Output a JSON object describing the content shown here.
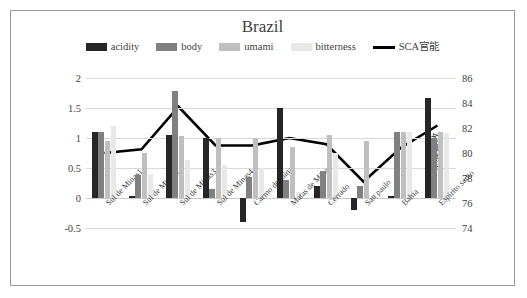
{
  "chart_data": {
    "type": "bar",
    "title": "Brazil",
    "categories": [
      "Sul de Minas1",
      "Sul de Minas2",
      "Sul de Minas3",
      "Sul de Minas4",
      "Carmo de minas",
      "Matas de Minas",
      "Cerrado",
      "San paulo",
      "Bahia",
      "Espirito santo"
    ],
    "series": [
      {
        "name": "acidity",
        "type": "bar",
        "color": "#262626",
        "values": [
          1.1,
          0.03,
          1.05,
          1.0,
          -0.4,
          1.5,
          0.2,
          -0.2,
          0.03,
          1.67
        ]
      },
      {
        "name": "body",
        "type": "bar",
        "color": "#808080",
        "values": [
          1.1,
          0.38,
          1.79,
          0.15,
          0.35,
          0.3,
          0.45,
          0.2,
          1.1,
          1.0
        ]
      },
      {
        "name": "umami",
        "type": "bar",
        "color": "#bfbfbf",
        "values": [
          0.95,
          0.75,
          1.03,
          1.0,
          1.0,
          0.85,
          1.05,
          0.95,
          1.1,
          1.1
        ]
      },
      {
        "name": "bitterness",
        "type": "bar",
        "color": "#e8e8e8",
        "values": [
          1.2,
          0.4,
          0.63,
          0.55,
          0.5,
          0.1,
          0.75,
          0.03,
          1.1,
          1.08
        ]
      },
      {
        "name": "SCA官能",
        "type": "line",
        "color": "#000000",
        "axis": "right",
        "values": [
          80.0,
          80.3,
          83.7,
          80.6,
          80.6,
          81.2,
          80.7,
          77.7,
          80.4,
          82.2
        ]
      }
    ],
    "xlabel": "",
    "ylabel": "強度",
    "ylabel_right": "SCA点数",
    "ylim": [
      -0.5,
      2
    ],
    "yticks": [
      "2",
      "1.5",
      "1",
      "0.5",
      "0",
      "-0.5"
    ],
    "ylim_right": [
      74,
      86
    ],
    "yticks_right": [
      "86",
      "84",
      "82",
      "80",
      "78",
      "76",
      "74"
    ],
    "grid": true,
    "legend_position": "top"
  },
  "legend": [
    {
      "label": "acidity",
      "swatch": "#262626",
      "kind": "swatch",
      "icon": "bar-swatch-icon"
    },
    {
      "label": "body",
      "swatch": "#808080",
      "kind": "swatch",
      "icon": "bar-swatch-icon"
    },
    {
      "label": "umami",
      "swatch": "#bfbfbf",
      "kind": "swatch",
      "icon": "bar-swatch-icon"
    },
    {
      "label": "bitterness",
      "swatch": "#e8e8e8",
      "kind": "swatch",
      "icon": "bar-swatch-icon"
    },
    {
      "label": "SCA官能",
      "swatch": "#000000",
      "kind": "line",
      "icon": "line-swatch-icon"
    }
  ]
}
